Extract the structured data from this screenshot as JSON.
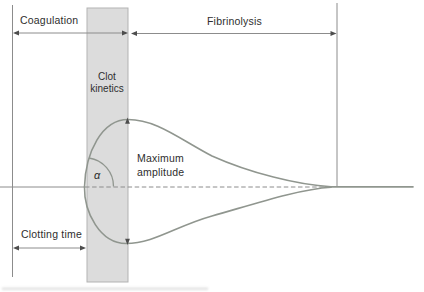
{
  "figure": {
    "phases": {
      "coagulation": "Coagulation",
      "fibrinolysis": "Fibrinolysis"
    },
    "band": {
      "label_line1": "Clot",
      "label_line2": "kinetics"
    },
    "measurements": {
      "clotting_time": "Clotting time",
      "maximum_amplitude_line1": "Maximum",
      "maximum_amplitude_line2": "amplitude",
      "alpha_angle": "α"
    },
    "colors": {
      "background": "#ffffff",
      "band_fill": "#dcdcdc",
      "band_border": "#b3b3b3",
      "trace": "#90968f",
      "guide_line": "#8c8c8c",
      "arrow_head": "#4d4d4d",
      "text": "#2e2e2e"
    }
  }
}
